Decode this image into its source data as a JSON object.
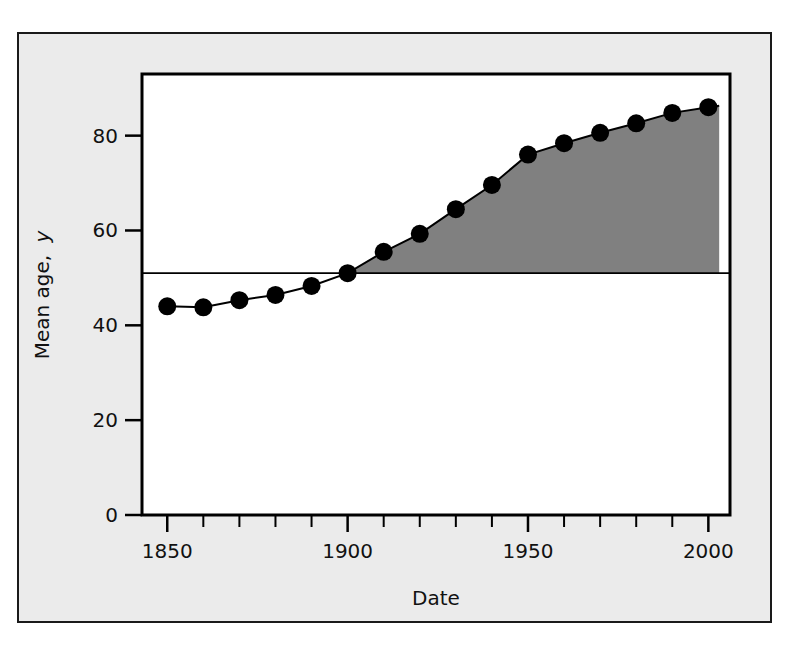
{
  "figure": {
    "background_color": "#ebebeb",
    "border_color": "#1a1a1a",
    "plot_background_color": "#ffffff"
  },
  "chart_data": {
    "type": "line",
    "title": "",
    "subtitle": "",
    "xlabel": "Date",
    "ylabel": "Mean age, y",
    "ylabel_parts": {
      "main": "Mean age,",
      "italic_symbol": "y"
    },
    "xlim": [
      1843,
      2006
    ],
    "ylim": [
      0,
      93
    ],
    "xticks_major": [
      1850,
      1900,
      1950,
      2000
    ],
    "xticks_major_labels": [
      "1850",
      "1900",
      "1950",
      "2000"
    ],
    "xticks_minor_step": 10,
    "xticks_all": [
      1850,
      1860,
      1870,
      1880,
      1890,
      1900,
      1910,
      1920,
      1930,
      1940,
      1950,
      1960,
      1970,
      1980,
      1990,
      2000
    ],
    "yticks": [
      0,
      20,
      40,
      60,
      80
    ],
    "ytick_labels": [
      "0",
      "20",
      "40",
      "60",
      "80"
    ],
    "grid": false,
    "legend": null,
    "legend_position": "none",
    "marker": "filled-circle",
    "marker_color": "#000000",
    "line_color": "#000000",
    "x": [
      1850,
      1860,
      1870,
      1880,
      1890,
      1900,
      1910,
      1920,
      1930,
      1940,
      1950,
      1960,
      1970,
      1980,
      1990,
      2000
    ],
    "values": [
      44.0,
      43.8,
      45.3,
      46.4,
      48.3,
      51.0,
      55.5,
      59.3,
      64.5,
      69.6,
      76.0,
      78.4,
      80.6,
      82.6,
      84.8,
      86.0
    ],
    "series": [
      {
        "name": "Mean age",
        "x": [
          1850,
          1860,
          1870,
          1880,
          1890,
          1900,
          1910,
          1920,
          1930,
          1940,
          1950,
          1960,
          1970,
          1980,
          1990,
          2000
        ],
        "values": [
          44.0,
          43.8,
          45.3,
          46.4,
          48.3,
          51.0,
          55.5,
          59.3,
          64.5,
          69.6,
          76.0,
          78.4,
          80.6,
          82.6,
          84.8,
          86.0
        ]
      }
    ],
    "reference_line": {
      "value": 51.0,
      "orientation": "horizontal",
      "color": "#000000",
      "from_x": 1843,
      "to_x": 2006
    },
    "shaded_region": {
      "label": "area between curve and reference line",
      "fill_color": "#808080",
      "from_x": 1900,
      "to_x": 2003,
      "baseline": 51.0
    },
    "curve_end_x": 2003,
    "curve_end_value": 86.3
  }
}
